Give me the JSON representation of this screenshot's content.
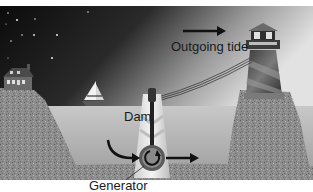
{
  "figure": {
    "labels": {
      "outgoing_tide": "Outgoing tide",
      "dam": "Dam",
      "generator": "Generator"
    },
    "elements": {
      "sky": "night-sky-with-stars",
      "left_cliff": "rocky-cliff-with-house",
      "right_cliff": "rocky-cliff-with-lighthouse",
      "water": "bay-water",
      "boat": "sailboat",
      "dam": "tidal-dam",
      "generator": "turbine-generator",
      "power_line": "transmission-line"
    },
    "colors": {
      "sky_dark": "#0e0e0e",
      "sky_light": "#d8d8d8",
      "water": "#b8b8b8",
      "rock": "#8a8a8a",
      "dam": "#e6e6e6",
      "text": "#1a1a1a"
    }
  }
}
